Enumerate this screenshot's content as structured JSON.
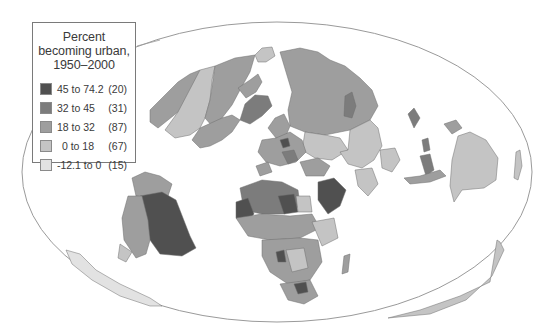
{
  "legend": {
    "title_lines": [
      "Percent",
      "becoming urban,",
      "1950–2000"
    ],
    "classes": [
      {
        "range": "45 to 74.2",
        "count": "(20)",
        "color": "#505050"
      },
      {
        "range": "32 to 45",
        "count": "(31)",
        "color": "#7c7c7c"
      },
      {
        "range": "18 to 32",
        "count": "(87)",
        "color": "#9e9e9e"
      },
      {
        "range": "0 to 18",
        "count": "(67)",
        "color": "#c4c4c4"
      },
      {
        "range": "-12.1 to 0",
        "count": "(15)",
        "color": "#e2e2e2"
      }
    ]
  },
  "map": {
    "projection_outline": "ellipse",
    "outline_color": "#9a9a9a",
    "background": "#ffffff"
  }
}
